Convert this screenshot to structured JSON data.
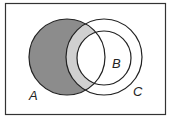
{
  "diagram": {
    "type": "venn",
    "universe": {
      "x": 5,
      "y": 3,
      "width": 160,
      "height": 111,
      "stroke": "#333333"
    },
    "sets": [
      {
        "id": "A",
        "label": "A",
        "cx": 67,
        "cy": 57,
        "r": 38,
        "label_x": 29,
        "label_y": 100
      },
      {
        "id": "C",
        "label": "C",
        "cx": 104,
        "cy": 57,
        "r": 38,
        "label_x": 133,
        "label_y": 96
      },
      {
        "id": "B",
        "label": "B",
        "cx": 104,
        "cy": 58,
        "r": 27,
        "label_x": 112,
        "label_y": 68
      }
    ],
    "shading": [
      {
        "region": "A minus C",
        "color": "#8c8c8c"
      },
      {
        "region": "(A and C) minus B",
        "color": "#d0d0d0"
      },
      {
        "region": "A and B",
        "color": "#ffffff"
      }
    ],
    "stroke_color": "#222222",
    "labels": {
      "A": "A",
      "B": "B",
      "C": "C"
    }
  }
}
